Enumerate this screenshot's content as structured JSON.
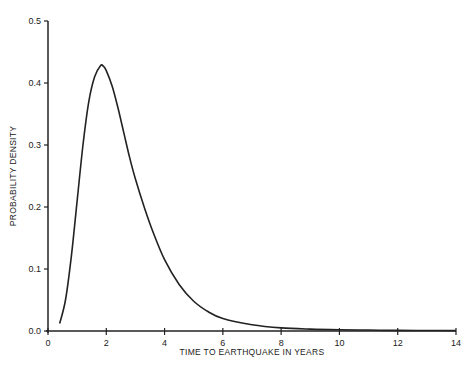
{
  "chart_data": {
    "type": "line",
    "title": "",
    "xlabel": "TIME TO EARTHQUAKE IN YEARS",
    "ylabel": "PROBABILITY DENSITY",
    "xlim": [
      0,
      14
    ],
    "ylim": [
      0,
      0.5
    ],
    "x_ticks": [
      "0",
      "2",
      "4",
      "6",
      "8",
      "10",
      "12",
      "14"
    ],
    "y_ticks": [
      "0.0",
      "0.1",
      "0.2",
      "0.3",
      "0.4",
      "0.5"
    ],
    "grid": false,
    "legend": null,
    "series": [
      {
        "name": "probability density",
        "x": [
          0.4,
          0.6,
          0.8,
          1.0,
          1.2,
          1.4,
          1.6,
          1.8,
          1.9,
          2.0,
          2.2,
          2.4,
          2.6,
          2.8,
          3.0,
          3.3,
          3.6,
          4.0,
          4.5,
          5.0,
          5.5,
          6.0,
          7.0,
          8.0,
          9.0,
          10.0,
          11.0,
          12.0,
          13.0,
          14.0
        ],
        "y": [
          0.012,
          0.05,
          0.12,
          0.21,
          0.3,
          0.37,
          0.41,
          0.428,
          0.427,
          0.42,
          0.395,
          0.36,
          0.32,
          0.28,
          0.245,
          0.2,
          0.16,
          0.115,
          0.075,
          0.048,
          0.031,
          0.02,
          0.01,
          0.005,
          0.003,
          0.002,
          0.0015,
          0.001,
          0.0008,
          0.0006
        ]
      }
    ]
  }
}
